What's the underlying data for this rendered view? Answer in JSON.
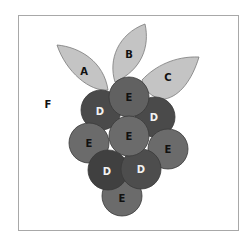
{
  "frame": {
    "x": 18,
    "y": 15,
    "width": 220,
    "height": 215,
    "stroke": "#a8a8a8"
  },
  "colors": {
    "leaf_fill": "#c4c4c4",
    "leaf_stroke": "#7a7a7a",
    "D_fill": "#4a4a4a",
    "E_fill": "#6b6b6b",
    "circle_stroke": "#3a3a3a",
    "label_dark": "#111111",
    "label_light": "#f2f2f2"
  },
  "leaves": [
    {
      "id": "A",
      "label": "A",
      "label_x": 84,
      "label_y": 71
    },
    {
      "id": "B",
      "label": "B",
      "label_x": 129,
      "label_y": 54
    },
    {
      "id": "C",
      "label": "C",
      "label_x": 168,
      "label_y": 77
    }
  ],
  "circles": [
    {
      "type": "E",
      "label": "E",
      "cx": 129,
      "cy": 97,
      "r": 20
    },
    {
      "type": "D",
      "label": "D",
      "cx": 101,
      "cy": 110,
      "r": 20
    },
    {
      "type": "D",
      "label": "D",
      "cx": 155,
      "cy": 117,
      "r": 20
    },
    {
      "type": "E",
      "label": "E",
      "cx": 89,
      "cy": 143,
      "r": 20
    },
    {
      "type": "E",
      "label": "E",
      "cx": 168,
      "cy": 149,
      "r": 20
    },
    {
      "type": "E",
      "label": "E",
      "cx": 129,
      "cy": 136,
      "r": 20
    },
    {
      "type": "D",
      "label": "D",
      "cx": 108,
      "cy": 170,
      "r": 20
    },
    {
      "type": "D",
      "label": "D",
      "cx": 141,
      "cy": 169,
      "r": 20
    },
    {
      "type": "E",
      "label": "E",
      "cx": 122,
      "cy": 196,
      "r": 20
    }
  ],
  "background_label": {
    "label": "F",
    "x": 48,
    "y": 104
  }
}
